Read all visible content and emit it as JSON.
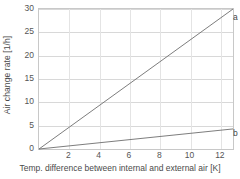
{
  "chart_data": {
    "type": "line",
    "title": "",
    "xlabel": "Temp. difference between internal and external air [K]",
    "ylabel": "Air change rate [1/h]",
    "xlim": [
      0,
      12.8
    ],
    "ylim": [
      0,
      30
    ],
    "grid": true,
    "legend_position": "inline-right",
    "x_ticks": [
      2,
      4,
      6,
      8,
      10,
      12
    ],
    "x_tick_labels": [
      "2",
      "4",
      "6",
      "8",
      "10",
      "12"
    ],
    "y_ticks": [
      0,
      5,
      10,
      15,
      20,
      25,
      30
    ],
    "y_tick_labels": [
      "0",
      "5",
      "10",
      "15",
      "20",
      "25",
      "30"
    ],
    "series": [
      {
        "name": "a",
        "label": "a",
        "color": "#6e6e6e",
        "x": [
          0,
          12.8
        ],
        "values": [
          0,
          30.0
        ]
      },
      {
        "name": "b",
        "label": "b",
        "color": "#6e6e6e",
        "x": [
          0,
          12.8
        ],
        "values": [
          0,
          4.3
        ]
      }
    ]
  },
  "colors": {
    "grid": "#d8d8d8",
    "border": "#c8c8c8",
    "line": "#6e6e6e",
    "text": "#4a4a4a",
    "background": "#ffffff"
  }
}
